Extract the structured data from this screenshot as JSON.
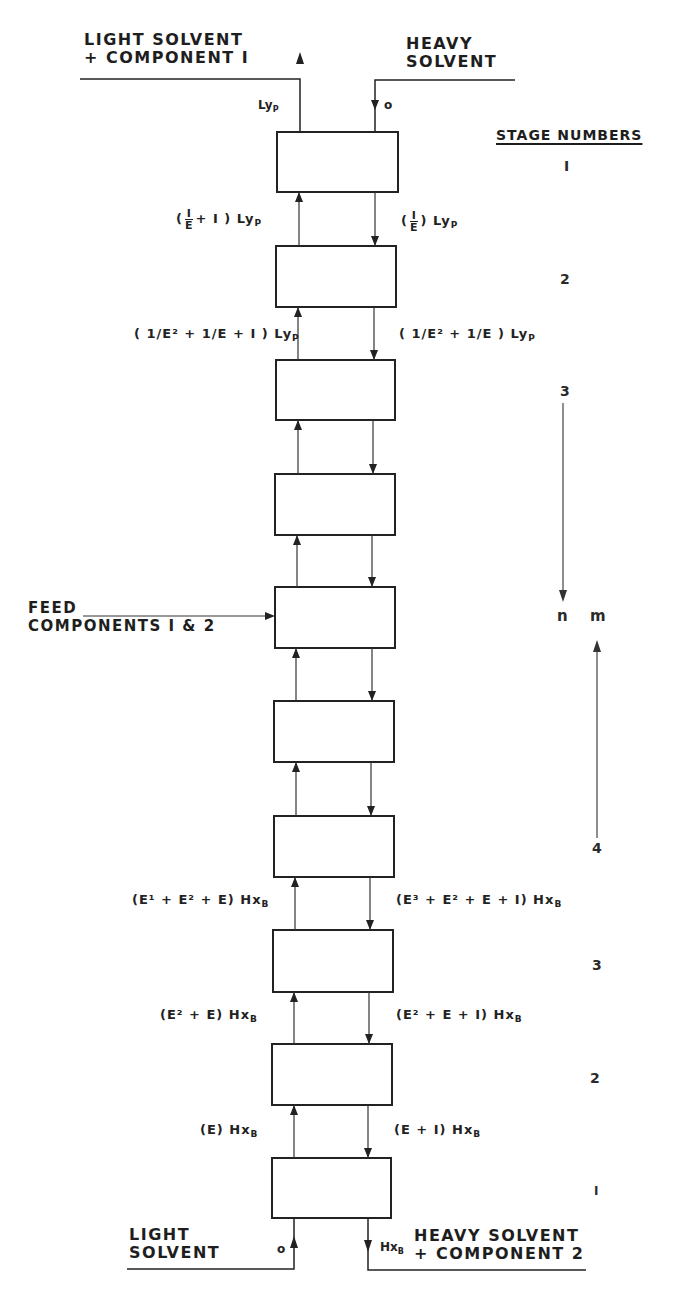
{
  "diagram": {
    "top_left_label": {
      "line1": "LIGHT SOLVENT",
      "line2": "+ COMPONENT I"
    },
    "top_right_label": {
      "line1": "HEAVY",
      "line2": "SOLVENT"
    },
    "bottom_left_label": {
      "line1": "LIGHT",
      "line2": "SOLVENT"
    },
    "bottom_right_label": {
      "line1": "HEAVY SOLVENT",
      "line2": "+ COMPONENT 2"
    },
    "feed_label": {
      "line1": "FEED",
      "line2": "COMPONENTS I & 2"
    },
    "stage_numbers_header": "STAGE NUMBERS",
    "top_flows": {
      "out_light": "Ly",
      "out_light_sub": "P",
      "in_heavy": "o"
    },
    "bottom_flows": {
      "in_light": "o",
      "out_heavy": "Hx",
      "out_heavy_sub": "B"
    },
    "upper_section_flows": [
      {
        "left": {
          "prefix": "(",
          "frac": [
            "I",
            "E"
          ],
          "suffix": "+ I ) Ly",
          "sub": "P"
        },
        "right": {
          "prefix": "(",
          "frac": [
            "I",
            "E"
          ],
          "suffix": ") Ly",
          "sub": "P"
        }
      },
      {
        "left": {
          "text": "( 1/E² + 1/E + I ) Ly",
          "sub": "P"
        },
        "right": {
          "text": "( 1/E² + 1/E ) Ly",
          "sub": "P"
        }
      }
    ],
    "lower_section_flows": [
      {
        "left": "(E¹ + E² + E) Hx",
        "left_sub": "B",
        "right": "(E³ + E² + E + I) Hx",
        "right_sub": "B"
      },
      {
        "left": "(E² + E) Hx",
        "left_sub": "B",
        "right": "(E² + E + I) Hx",
        "right_sub": "B"
      },
      {
        "left": "(E) Hx",
        "left_sub": "B",
        "right": "(E + I) Hx",
        "right_sub": "B"
      }
    ],
    "stage_numbers_top": [
      "I",
      "2",
      "3"
    ],
    "stage_markers": {
      "n": "n",
      "m": "m"
    },
    "stage_numbers_bottom": [
      "4",
      "3",
      "2",
      "I"
    ],
    "num_stages": 10,
    "feed_stage_index": 5
  }
}
